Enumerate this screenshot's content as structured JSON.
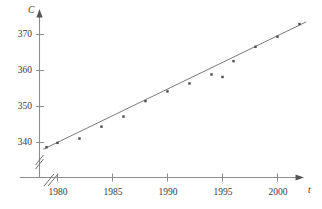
{
  "chart_data": {
    "type": "scatter",
    "title": "",
    "subtitle": "",
    "xlabel": "t",
    "ylabel": "C",
    "xlim": [
      1978.2,
      2002.8
    ],
    "ylim": [
      336.5,
      374.5
    ],
    "grid": false,
    "legend": "none",
    "axis_break_x": true,
    "axis_break_y": true,
    "xticks": [
      1980,
      1985,
      1990,
      1995,
      2000
    ],
    "xtick_labels": [
      "1980",
      "1985",
      "1990",
      "1995",
      "2000"
    ],
    "yticks": [
      340,
      350,
      360,
      370
    ],
    "ytick_labels": [
      "340",
      "350",
      "360",
      "370"
    ],
    "x": [
      1979,
      1980,
      1982,
      1984,
      1986,
      1988,
      1990,
      1992,
      1994,
      1995,
      1996,
      1998,
      2000,
      2002
    ],
    "y": [
      338.7,
      339.9,
      341.1,
      344.4,
      347.2,
      351.5,
      354.2,
      356.4,
      358.9,
      358.2,
      362.6,
      366.6,
      369.4,
      372.9
    ],
    "series": [
      {
        "name": "observations",
        "marker": "square-dot",
        "x": [
          1979,
          1980,
          1982,
          1984,
          1986,
          1988,
          1990,
          1992,
          1994,
          1995,
          1996,
          1998,
          2000,
          2002
        ],
        "y": [
          338.7,
          339.9,
          341.1,
          344.4,
          347.2,
          351.5,
          354.2,
          356.4,
          358.9,
          358.2,
          362.6,
          366.6,
          369.4,
          372.9
        ]
      },
      {
        "name": "regression-line",
        "type": "line",
        "x_endpoints": [
          1978.7,
          2002.6
        ],
        "y_endpoints": [
          338.1,
          373.5
        ]
      }
    ],
    "colors": {
      "axis": "#8c8c8c",
      "marker": "#4a4a4a",
      "line": "#7a7a7a",
      "text": "#3a3a3a"
    }
  },
  "axes": {
    "y_name": "C",
    "x_name": "t"
  }
}
